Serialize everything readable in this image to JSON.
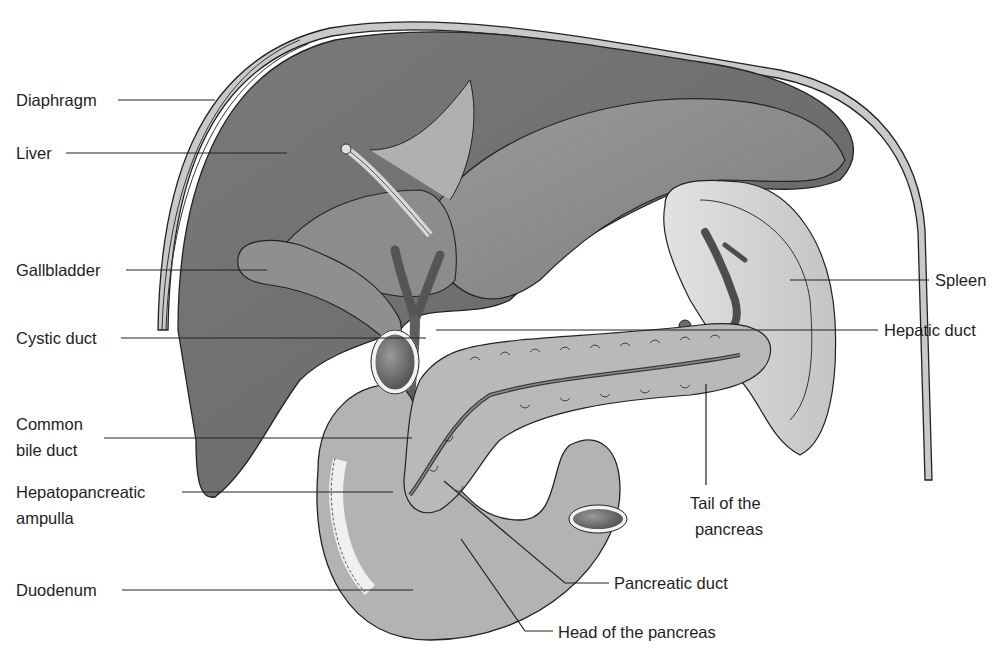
{
  "figure": {
    "type": "anatomical-illustration",
    "colors": {
      "background": "#ffffff",
      "liver_dark": "#6e6e6e",
      "liver_mid": "#8a8a8a",
      "liver_light": "#a3a3a3",
      "diaphragm_band": "#c9c9c9",
      "pancreas": "#b9b9b9",
      "spleen": "#d6d6d6",
      "duodenum": "#b3b3b3",
      "duct": "#7a7a7a",
      "outline": "#222222",
      "label_text": "#1e1e1e"
    }
  },
  "labels": {
    "diaphragm": "Diaphragm",
    "liver": "Liver",
    "gallbladder": "Gallbladder",
    "cystic_duct": "Cystic duct",
    "common_bile_duct_line1": "Common",
    "common_bile_duct_line2": "bile duct",
    "ampulla_line1": "Hepatopancreatic",
    "ampulla_line2": "ampulla",
    "duodenum": "Duodenum",
    "spleen": "Spleen",
    "hepatic_duct": "Hepatic duct",
    "tail_line1": "Tail of the",
    "tail_line2": "pancreas",
    "pancreatic_duct": "Pancreatic duct",
    "head_of_pancreas": "Head of the pancreas"
  }
}
